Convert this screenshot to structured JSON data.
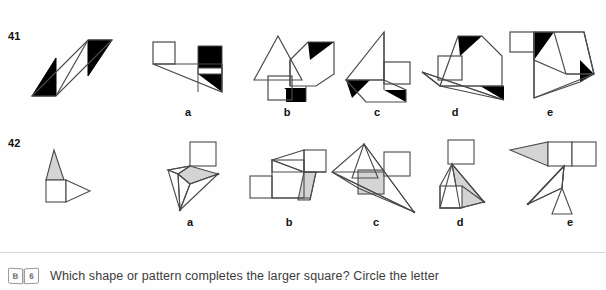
{
  "page": {
    "background": "#ffffff",
    "fill_black": "#000000",
    "fill_gray": "#d4d4d4",
    "stroke": "#4a4a4a"
  },
  "rows": [
    {
      "number": "41",
      "question_figure_name": "parallelogram-with-black-corner-triangles",
      "options": [
        {
          "letter": "a",
          "name": "option-a-figure"
        },
        {
          "letter": "b",
          "name": "option-b-figure"
        },
        {
          "letter": "c",
          "name": "option-c-figure"
        },
        {
          "letter": "d",
          "name": "option-d-figure"
        },
        {
          "letter": "e",
          "name": "option-e-figure"
        }
      ]
    },
    {
      "number": "42",
      "question_figure_name": "square-with-gray-triangle-and-arrow",
      "options": [
        {
          "letter": "a",
          "name": "option-a-figure"
        },
        {
          "letter": "b",
          "name": "option-b-figure"
        },
        {
          "letter": "c",
          "name": "option-c-figure"
        },
        {
          "letter": "d",
          "name": "option-d-figure"
        },
        {
          "letter": "e",
          "name": "option-e-figure"
        }
      ]
    }
  ],
  "footer": {
    "icon": "open-book-icon",
    "icon_left_page": "B",
    "icon_right_page": "6",
    "instruction": "Which shape or pattern completes the larger square? Circle the letter"
  }
}
